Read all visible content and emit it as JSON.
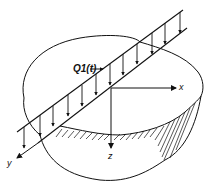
{
  "diagram": {
    "type": "line-load on elastic half-space",
    "labels": {
      "load": "Q1(t)",
      "x_axis": "x",
      "y_axis": "y",
      "z_axis": "z"
    },
    "elements": [
      "soil-body",
      "line-load-strip",
      "downward-load-arrows",
      "coordinate-axes",
      "hatched-cut-face"
    ],
    "colors": {
      "stroke": "#111111",
      "background": "#ffffff"
    }
  }
}
